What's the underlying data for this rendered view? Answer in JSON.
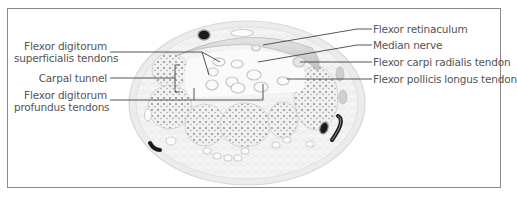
{
  "figure": {
    "labels_left": [
      {
        "id": "fds",
        "line1": "Flexor digitorum",
        "line2": "superficialis tendons"
      },
      {
        "id": "carpal",
        "line1": "Carpal tunnel"
      },
      {
        "id": "fdp",
        "line1": "Flexor digitorum",
        "line2": "profundus tendons"
      }
    ],
    "labels_right": [
      {
        "id": "retinaculum",
        "text": "Flexor retinaculum"
      },
      {
        "id": "median",
        "text": "Median nerve"
      },
      {
        "id": "fcr",
        "text": "Flexor carpi radialis tendon"
      },
      {
        "id": "fpl",
        "text": "Flexor pollicis longus tendon"
      }
    ],
    "colors": {
      "frame": "#8a8a8a",
      "leader_line": "#444444",
      "tissue_fill": "#efefef",
      "tissue_outline": "#d2d2d2",
      "bone_dots": "#9a9a9a",
      "vessel_dark": "#1a1a1a",
      "label_text": "#555555"
    }
  }
}
